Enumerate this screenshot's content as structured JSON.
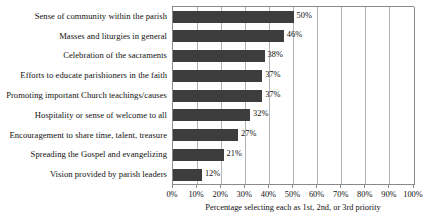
{
  "chart_data": {
    "type": "bar",
    "orientation": "horizontal",
    "title": "",
    "xlabel": "Percentage selecting each as 1st, 2nd, or 3rd priority",
    "ylabel": "",
    "xlim": [
      0,
      100
    ],
    "grid": "vertical",
    "legend": "none",
    "value_suffix": "%",
    "categories": [
      "Sense of community within the parish",
      "Masses and liturgies in general",
      "Celebration of the sacraments",
      "Efforts to educate parishioners in the faith",
      "Promoting important Church teachings/causes",
      "Hospitality or sense of welcome to all",
      "Encouragement to share time, talent, treasure",
      "Spreading the Gospel and evangelizing",
      "Vision provided by parish leaders"
    ],
    "values": [
      50,
      46,
      38,
      37,
      37,
      32,
      27,
      21,
      12
    ],
    "data_labels": [
      "50%",
      "46%",
      "38%",
      "37%",
      "37%",
      "32%",
      "27%",
      "21%",
      "12%"
    ],
    "xticks": [
      0,
      10,
      20,
      30,
      40,
      50,
      60,
      70,
      80,
      90,
      100
    ],
    "xtick_labels": [
      "0%",
      "10%",
      "20%",
      "30%",
      "40%",
      "50%",
      "60%",
      "70%",
      "80%",
      "90%",
      "100%"
    ],
    "bar_color": "#3d3d3d",
    "grid_color": "#b4b4b4",
    "axis_color": "#8a8a8a",
    "background_color": "#ffffff",
    "text_color": "#111111"
  }
}
